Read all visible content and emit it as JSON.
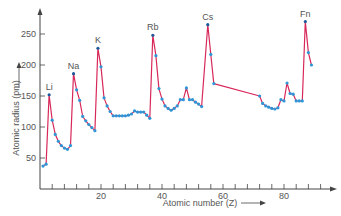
{
  "chart_data": {
    "type": "line",
    "title": "",
    "xlabel": "Atomic number (Z)",
    "ylabel": "Atomic radius (pm)",
    "xticks": [
      20,
      40,
      60,
      80
    ],
    "yticks": [
      50,
      100,
      150,
      200,
      250
    ],
    "xlim": [
      0,
      95
    ],
    "ylim": [
      0,
      290
    ],
    "grid": false,
    "legend": null,
    "annotations": [
      {
        "text": "Li",
        "z": 3
      },
      {
        "text": "Na",
        "z": 11
      },
      {
        "text": "K",
        "z": 19
      },
      {
        "text": "Rb",
        "z": 37
      },
      {
        "text": "Cs",
        "z": 55
      },
      {
        "text": "Fn",
        "z": 87
      }
    ],
    "series": [
      {
        "name": "Atomic radius",
        "points": [
          [
            1,
            37
          ],
          [
            2,
            40
          ],
          [
            3,
            152
          ],
          [
            4,
            111
          ],
          [
            5,
            88
          ],
          [
            6,
            77
          ],
          [
            7,
            70
          ],
          [
            8,
            66
          ],
          [
            9,
            64
          ],
          [
            10,
            70
          ],
          [
            11,
            186
          ],
          [
            12,
            160
          ],
          [
            13,
            143
          ],
          [
            14,
            117
          ],
          [
            15,
            110
          ],
          [
            16,
            104
          ],
          [
            17,
            99
          ],
          [
            18,
            94
          ],
          [
            19,
            227
          ],
          [
            20,
            197
          ],
          [
            21,
            147
          ],
          [
            22,
            134
          ],
          [
            23,
            125
          ],
          [
            24,
            118
          ],
          [
            25,
            118
          ],
          [
            26,
            118
          ],
          [
            27,
            118
          ],
          [
            28,
            118
          ],
          [
            29,
            119
          ],
          [
            30,
            121
          ],
          [
            31,
            126
          ],
          [
            32,
            124
          ],
          [
            33,
            124
          ],
          [
            34,
            124
          ],
          [
            35,
            119
          ],
          [
            36,
            114
          ],
          [
            37,
            248
          ],
          [
            38,
            215
          ],
          [
            39,
            162
          ],
          [
            40,
            145
          ],
          [
            41,
            134
          ],
          [
            42,
            130
          ],
          [
            43,
            127
          ],
          [
            44,
            130
          ],
          [
            45,
            134
          ],
          [
            46,
            144
          ],
          [
            47,
            144
          ],
          [
            48,
            163
          ],
          [
            49,
            144
          ],
          [
            50,
            144
          ],
          [
            51,
            140
          ],
          [
            52,
            137
          ],
          [
            53,
            133
          ],
          [
            55,
            265
          ],
          [
            56,
            217
          ],
          [
            57,
            170
          ],
          [
            72,
            150
          ],
          [
            73,
            138
          ],
          [
            74,
            134
          ],
          [
            75,
            132
          ],
          [
            76,
            130
          ],
          [
            77,
            129
          ],
          [
            78,
            131
          ],
          [
            79,
            144
          ],
          [
            80,
            142
          ],
          [
            81,
            171
          ],
          [
            82,
            154
          ],
          [
            83,
            153
          ],
          [
            84,
            142
          ],
          [
            85,
            142
          ],
          [
            86,
            142
          ],
          [
            87,
            270
          ],
          [
            88,
            220
          ],
          [
            89,
            200
          ]
        ]
      }
    ]
  },
  "colors": {
    "line": "#d8285a",
    "marker": "#2e96d6",
    "marker_peak": "#1e5a9a",
    "axis": "#444444",
    "text": "#555555"
  }
}
